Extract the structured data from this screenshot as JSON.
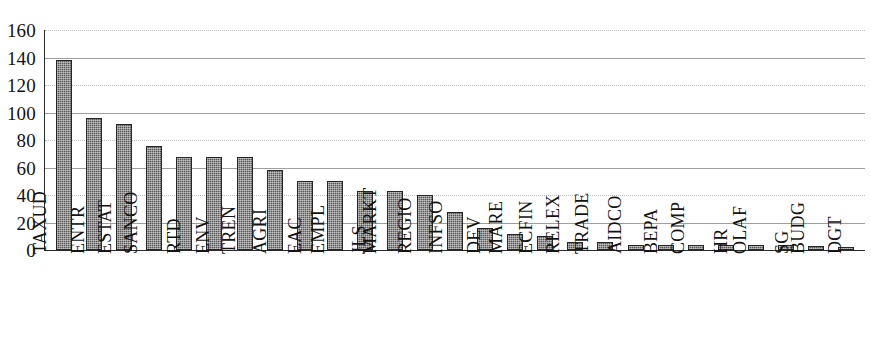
{
  "chart_data": {
    "type": "bar",
    "title": "",
    "subtitle": "",
    "xlabel": "",
    "ylabel": "",
    "ylim": [
      0,
      160
    ],
    "ytick_step": 20,
    "yticks": [
      160,
      140,
      120,
      100,
      80,
      60,
      40,
      20,
      0
    ],
    "ytick_labels": [
      "160",
      "140",
      "120",
      "100",
      "80",
      "60",
      "40",
      "20",
      "0"
    ],
    "grid": true,
    "grid_axis": "y",
    "legend": false,
    "legend_position": "none",
    "orientation": "vertical",
    "xtick_rotation": -90,
    "categories": [
      "TAXUD",
      "ENTR",
      "ESTAT",
      "SANCO",
      "RTD",
      "ENV",
      "TREN",
      "AGRI",
      "EAC",
      "EMPL",
      "JLS",
      "MARKT",
      "REGIO",
      "INFSO",
      "DEV",
      "MARE",
      "ECFIN",
      "RELEX",
      "TRADE",
      "AIDCO",
      "BEPA",
      "COMP",
      "HR",
      "OLAF",
      "SG",
      "BUDG",
      "DGT"
    ],
    "values": [
      138,
      96,
      92,
      76,
      68,
      68,
      68,
      58,
      50,
      50,
      43,
      43,
      40,
      28,
      16,
      12,
      10,
      6,
      6,
      4,
      4,
      4,
      4,
      4,
      4,
      3,
      2
    ],
    "series": [
      {
        "name": "",
        "values": [
          138,
          96,
          92,
          76,
          68,
          68,
          68,
          58,
          50,
          50,
          43,
          43,
          40,
          28,
          16,
          12,
          10,
          6,
          6,
          4,
          4,
          4,
          4,
          4,
          4,
          3,
          2
        ]
      }
    ],
    "colors": {
      "bar_fill": "#585858",
      "bar_border": "#262626",
      "gridline": "#8d8d8d",
      "axis": "#2a2a2a",
      "background": "#ffffff",
      "text": "#131313"
    }
  }
}
